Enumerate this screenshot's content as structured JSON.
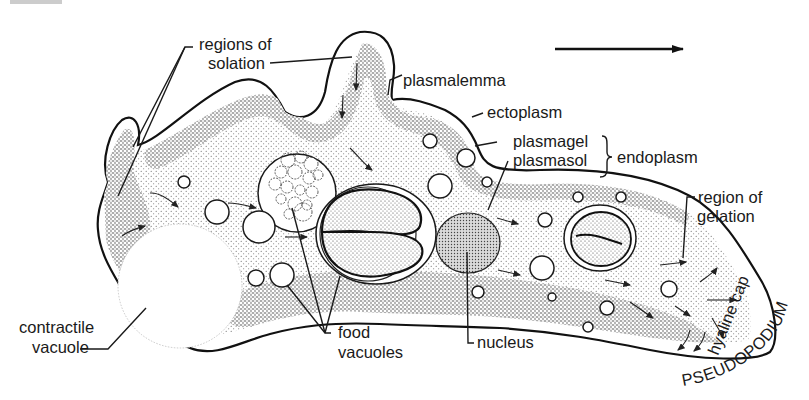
{
  "figure": {
    "direction_arrow": "direction-of-movement-arrow"
  },
  "labels": {
    "regions_of_solation_1": "regions of",
    "regions_of_solation_2": "solation",
    "plasmalemma": "plasmalemma",
    "ectoplasm": "ectoplasm",
    "plasmagel": "plasmagel",
    "plasmasol": "plasmasol",
    "endoplasm": "endoplasm",
    "region_of_gelation_1": "region of",
    "region_of_gelation_2": "gelation",
    "contractile_vacuole_1": "contractile",
    "contractile_vacuole_2": "vacuole",
    "food_vacuoles_1": "food",
    "food_vacuoles_2": "vacuoles",
    "nucleus": "nucleus",
    "hyaline_cap": "hyaline cap",
    "pseudopodium": "PSEUDOPODIUM"
  },
  "colors": {
    "ink": "#1a1a1a",
    "paper": "#ffffff",
    "stipple_dense": "#7a7a7a",
    "stipple_light": "#b8b8b8"
  }
}
